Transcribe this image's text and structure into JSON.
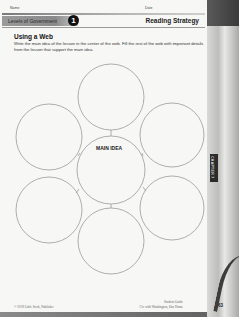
{
  "header": {
    "name_label": "Name",
    "date_label": "Date",
    "lesson_title": "Levels of Government",
    "lesson_number": "1",
    "section": "Reading Strategy"
  },
  "activity": {
    "title": "Using a Web",
    "instructions": "Write the main idea of the lesson in the center of the web. Fill the rest of the web with important details from the lesson that support the main idea."
  },
  "web": {
    "center_label": "MAIN IDEA",
    "circles": [
      {
        "id": "center",
        "cx": 111,
        "cy": 170,
        "r": 34
      },
      {
        "id": "top",
        "cx": 111,
        "cy": 97,
        "r": 33
      },
      {
        "id": "upper-left",
        "cx": 49,
        "cy": 137,
        "r": 33
      },
      {
        "id": "upper-right",
        "cx": 172,
        "cy": 135,
        "r": 32
      },
      {
        "id": "lower-left",
        "cx": 49,
        "cy": 210,
        "r": 33
      },
      {
        "id": "lower-right",
        "cx": 172,
        "cy": 208,
        "r": 32
      },
      {
        "id": "bottom",
        "cx": 111,
        "cy": 241,
        "r": 33
      }
    ],
    "stroke_color": "#9a9a9a"
  },
  "chapter_tab": "CHAPTER 7",
  "footer": {
    "copyright": "© 2019 Little Scott, Publisher",
    "guide_line1": "Student Guide",
    "guide_line2": "Civ with Washington, Our Home",
    "page_number": "63"
  }
}
